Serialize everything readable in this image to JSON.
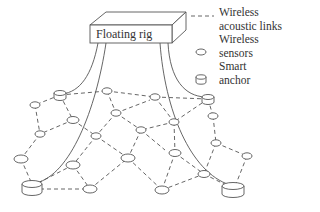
{
  "rig": {
    "label": "Floating rig"
  },
  "legend": {
    "items": [
      {
        "symbol": "dashed-line",
        "line1": "Wireless",
        "line2": "acoustic links"
      },
      {
        "symbol": "ellipse",
        "line1": "Wireless",
        "line2": "sensors"
      },
      {
        "symbol": "cylinder",
        "line1": "Smart",
        "line2": "anchor"
      }
    ]
  },
  "colors": {
    "stroke": "#555555",
    "text": "#333333",
    "background": "#ffffff"
  },
  "network": {
    "anchors": [
      {
        "id": "A1",
        "x": 60,
        "y": 95,
        "size": "small"
      },
      {
        "id": "A2",
        "x": 208,
        "y": 99,
        "size": "small"
      },
      {
        "id": "A3",
        "x": 32,
        "y": 187,
        "size": "large"
      },
      {
        "id": "A4",
        "x": 233,
        "y": 189,
        "size": "large"
      }
    ],
    "sensors": [
      {
        "id": "S1",
        "x": 35,
        "y": 105
      },
      {
        "id": "S2",
        "x": 107,
        "y": 91
      },
      {
        "id": "S3",
        "x": 73,
        "y": 120
      },
      {
        "id": "S4",
        "x": 116,
        "y": 113
      },
      {
        "id": "S5",
        "x": 155,
        "y": 97
      },
      {
        "id": "S6",
        "x": 40,
        "y": 134
      },
      {
        "id": "S7",
        "x": 96,
        "y": 136
      },
      {
        "id": "S8",
        "x": 141,
        "y": 130
      },
      {
        "id": "S9",
        "x": 174,
        "y": 122
      },
      {
        "id": "S10",
        "x": 213,
        "y": 116
      },
      {
        "id": "S11",
        "x": 21,
        "y": 159
      },
      {
        "id": "S12",
        "x": 73,
        "y": 165
      },
      {
        "id": "S13",
        "x": 128,
        "y": 158
      },
      {
        "id": "S14",
        "x": 175,
        "y": 153
      },
      {
        "id": "S15",
        "x": 216,
        "y": 143
      },
      {
        "id": "S16",
        "x": 247,
        "y": 156
      },
      {
        "id": "S17",
        "x": 90,
        "y": 189
      },
      {
        "id": "S18",
        "x": 162,
        "y": 190
      },
      {
        "id": "S19",
        "x": 204,
        "y": 174
      }
    ]
  }
}
